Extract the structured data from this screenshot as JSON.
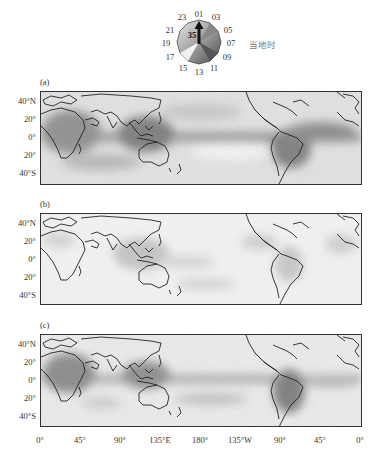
{
  "clock": {
    "hours": [
      "01",
      "03",
      "05",
      "07",
      "09",
      "11",
      "13",
      "15",
      "17",
      "19",
      "21",
      "23"
    ],
    "center_value": "35",
    "legend_label": "当地时"
  },
  "panels": [
    {
      "label": "(a)"
    },
    {
      "label": "(b)"
    },
    {
      "label": "(c)"
    }
  ],
  "y_axis": {
    "ticks": [
      "40°N",
      "20°",
      "0°",
      "20°",
      "40°S"
    ]
  },
  "x_axis": {
    "ticks": [
      "0°",
      "45°",
      "90°",
      "135°E",
      "180°",
      "135°W",
      "90°",
      "45°",
      "0°"
    ]
  },
  "colors": {
    "frame": "#333333",
    "coast": "#222222",
    "shade_dark": "#6e6e6e",
    "shade_light": "#f0f0f0"
  }
}
